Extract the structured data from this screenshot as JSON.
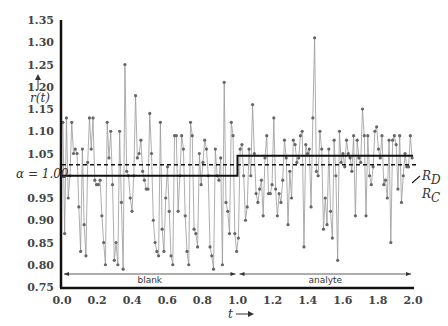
{
  "chart_data": {
    "type": "line",
    "title": "",
    "xlabel": "t →",
    "ylabel": "r(t) ↑",
    "xlim": [
      0.0,
      2.0
    ],
    "ylim": [
      0.75,
      1.35
    ],
    "x_ticks": [
      "0.0",
      "0.2",
      "0.4",
      "0.6",
      "0.8",
      "1.0",
      "1.2",
      "1.4",
      "1.6",
      "1.8",
      "2.0"
    ],
    "y_ticks": [
      "0.75",
      "0.80",
      "0.85",
      "0.90",
      "0.95",
      "1.00",
      "1.05",
      "1.10",
      "1.15",
      "1.20",
      "1.25",
      "1.30",
      "1.35"
    ],
    "alpha_label": "α = 1.00",
    "grid": false,
    "regions": [
      {
        "label": "blank",
        "x_start": 0.0,
        "x_end": 1.0
      },
      {
        "label": "analyte",
        "x_start": 1.0,
        "x_end": 2.0
      }
    ],
    "reference_lines": [
      {
        "name": "R_D",
        "style": "solid step",
        "segments": [
          {
            "x": [
              0.0,
              1.0
            ],
            "y": 1.0
          },
          {
            "x": [
              1.0,
              2.0
            ],
            "y": 1.045
          }
        ]
      },
      {
        "name": "R_C",
        "style": "dashed",
        "y": 1.025
      }
    ],
    "annotations": [
      "R_D",
      "R_C"
    ],
    "series": [
      {
        "name": "r(t)",
        "marker": "dot",
        "values": [
          1.12,
          0.87,
          1.13,
          0.95,
          1.0,
          1.12,
          1.05,
          1.06,
          1.05,
          0.93,
          0.83,
          1.06,
          0.89,
          0.82,
          1.03,
          1.13,
          1.06,
          1.13,
          0.99,
          0.98,
          0.98,
          0.99,
          0.91,
          0.85,
          0.8,
          1.12,
          1.04,
          1.1,
          0.98,
          0.81,
          0.85,
          0.8,
          1.1,
          0.94,
          0.79,
          1.25,
          1.01,
          1.0,
          0.95,
          0.92,
          1.0,
          1.18,
          1.04,
          1.05,
          1.08,
          1.01,
          0.99,
          0.97,
          0.97,
          1.14,
          1.05,
          0.9,
          0.85,
          0.83,
          0.82,
          1.12,
          0.88,
          0.83,
          0.95,
          1.02,
          0.92,
          0.82,
          0.8,
          1.09,
          1.09,
          0.92,
          1.0,
          1.09,
          1.06,
          0.91,
          0.83,
          0.8,
          1.12,
          1.09,
          0.88,
          0.87,
          0.84,
          1.05,
          0.98,
          1.03,
          1.08,
          1.06,
          1.0,
          0.84,
          0.82,
          0.79,
          1.06,
          1.0,
          0.99,
          1.04,
          0.8,
          1.21,
          0.94,
          0.92,
          0.87,
          1.12,
          1.09,
          0.87,
          0.83,
          0.86,
          1.06,
          1.07,
          1.0,
          0.9,
          0.93,
          1.06,
          1.0,
          1.16,
          1.05,
          0.96,
          0.94,
          0.97,
          0.99,
          0.91,
          1.04,
          1.09,
          0.96,
          0.96,
          0.98,
          1.13,
          0.97,
          0.91,
          0.96,
          0.94,
          0.99,
          1.08,
          1.04,
          0.89,
          1.01,
          0.95,
          1.08,
          1.07,
          1.03,
          1.04,
          1.09,
          1.1,
          0.84,
          1.07,
          1.05,
          1.06,
          0.93,
          1.13,
          1.31,
          1.01,
          1.0,
          1.1,
          1.06,
          0.88,
          0.95,
          0.89,
          1.06,
          0.92,
          0.86,
          1.08,
          1.0,
          0.81,
          1.1,
          1.03,
          1.05,
          1.02,
          1.08,
          1.05,
          1.04,
          1.01,
          1.09,
          0.91,
          1.08,
          1.04,
          1.03,
          1.15,
          1.09,
          0.91,
          1.09,
          1.0,
          0.98,
          1.02,
          1.1,
          1.11,
          1.06,
          1.04,
          1.09,
          0.98,
          0.99,
          0.95,
          1.08,
          0.85,
          1.08,
          1.09,
          1.07,
          0.97,
          1.09,
          0.94,
          1.0,
          1.05,
          1.02,
          1.02,
          1.09,
          1.04
        ]
      }
    ]
  }
}
